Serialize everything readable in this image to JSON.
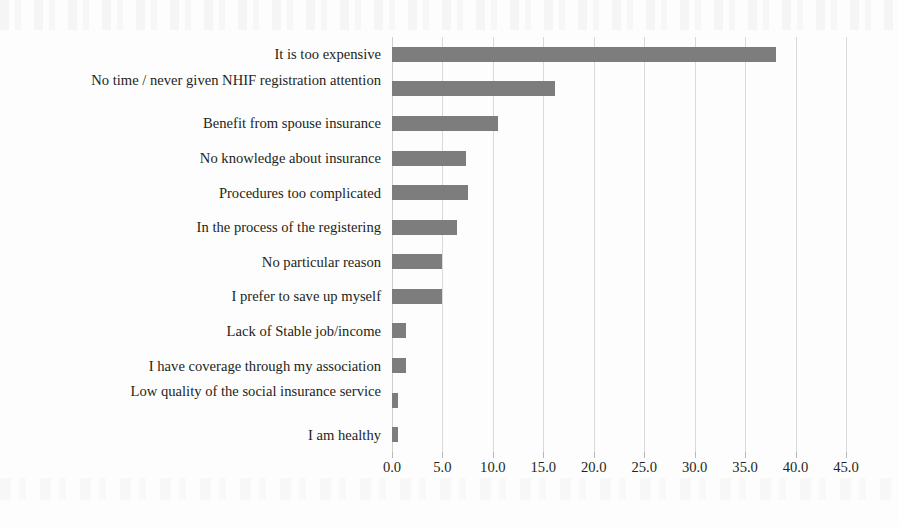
{
  "chart_data": {
    "type": "bar",
    "orientation": "horizontal",
    "title": "",
    "subtitle": "",
    "xlabel": "",
    "ylabel": "",
    "categories": [
      "It is too expensive",
      "No time / never given NHIF registration attention",
      "Benefit from spouse insurance",
      "No knowledge about insurance",
      "Procedures too complicated",
      "In the process of the registering",
      "No particular reason",
      "I prefer to save up myself",
      "Lack of Stable job/income",
      "I have coverage through my association",
      "Low quality of the social insurance service",
      "I am healthy"
    ],
    "values": [
      38.1,
      16.2,
      10.5,
      7.3,
      7.5,
      6.4,
      5.0,
      5.0,
      1.4,
      1.4,
      0.6,
      0.6
    ],
    "xlim": [
      0.0,
      45.0
    ],
    "xticks": [
      0.0,
      5.0,
      10.0,
      15.0,
      20.0,
      25.0,
      30.0,
      35.0,
      40.0,
      45.0
    ],
    "xtick_labels": [
      "0.0",
      "5.0",
      "10.0",
      "15.0",
      "20.0",
      "25.0",
      "30.0",
      "35.0",
      "40.0",
      "45.0"
    ],
    "grid": "vertical",
    "legend": null,
    "bar_color": "#7d7d7d",
    "grid_color": "#d9d9d9",
    "text_color": "#231f20",
    "background": "#fdfdfd"
  }
}
